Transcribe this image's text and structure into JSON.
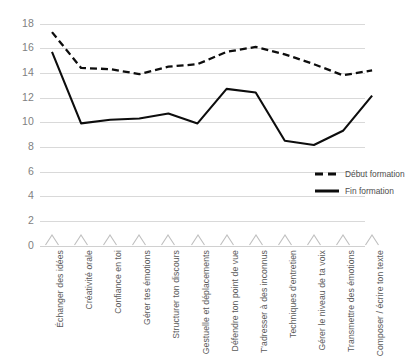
{
  "chart_data": {
    "type": "line",
    "title": "",
    "subtitle": "",
    "xlabel": "",
    "ylabel": "",
    "ylim": [
      0,
      18
    ],
    "y_ticks": [
      0,
      2,
      4,
      6,
      8,
      10,
      12,
      14,
      16,
      18
    ],
    "grid": "horizontal",
    "legend_position": "right",
    "categories": [
      "Échanger des idées",
      "Créativité orale",
      "Confiance en toi",
      "Gérer tes émotions",
      "Structurer ton discours",
      "Gestuelle et déplacements",
      "Défendre ton point de vue",
      "T'adresser à des inconnus",
      "Techniques d'entretien",
      "Gérer le niveau de ta voix",
      "Transmettre des émotions",
      "Composer / écrire ton texte"
    ],
    "series": [
      {
        "name": "Début formation",
        "style": "dashed",
        "color": "#0d0d0d",
        "values": [
          17.3,
          14.4,
          14.3,
          13.9,
          14.5,
          14.7,
          15.7,
          16.1,
          15.5,
          14.7,
          13.8,
          14.2
        ]
      },
      {
        "name": "Fin formation",
        "style": "solid",
        "color": "#0d0d0d",
        "values": [
          15.7,
          9.9,
          10.2,
          10.3,
          10.7,
          9.9,
          12.7,
          12.4,
          8.5,
          8.15,
          9.3,
          12.15
        ]
      }
    ]
  },
  "legend": {
    "items": [
      {
        "label": "Début formation",
        "style": "dashed"
      },
      {
        "label": "Fin formation",
        "style": "solid"
      }
    ]
  },
  "colors": {
    "gridline": "#d9d9d9",
    "tick_text": "#7f7f7f",
    "label_text": "#5a5a5a",
    "series_line": "#0d0d0d",
    "chevron": "#bfbfbf",
    "background": "#ffffff"
  }
}
